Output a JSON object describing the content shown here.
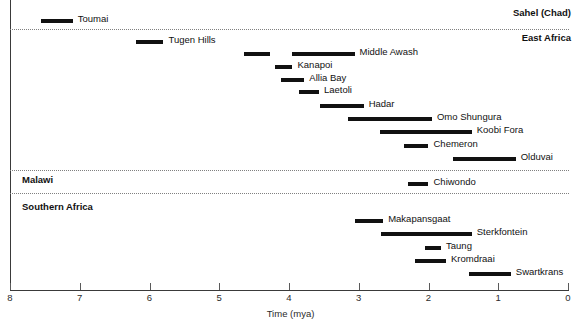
{
  "chart_data": {
    "type": "bar",
    "title": "",
    "subtitle": "",
    "xlabel": "Time (mya)",
    "ylabel": "",
    "xlim": [
      8,
      0
    ],
    "x_reversed": true,
    "grid": false,
    "legend": null,
    "orientation": "horizontal-ranges",
    "xticks": [
      8,
      7,
      6,
      5,
      4,
      3,
      2,
      1,
      0
    ],
    "xtick_labels": [
      "8",
      "7",
      "6",
      "5",
      "4",
      "3",
      "2",
      "1",
      "0"
    ],
    "groups": [
      {
        "region": "Sahel (Chad)",
        "region_label_align": "right",
        "sites": [
          {
            "name": "Toumai",
            "start_mya": 7.55,
            "end_mya": 7.1,
            "label_side": "right"
          }
        ]
      },
      {
        "region": "East Africa",
        "region_label_align": "right",
        "sites": [
          {
            "name": "Tugen Hills",
            "start_mya": 6.2,
            "end_mya": 5.8,
            "label_side": "right"
          },
          {
            "name": "Middle Awash",
            "start_mya": 4.65,
            "end_mya": 4.27,
            "label_side": "none",
            "segment": 1
          },
          {
            "name": "Middle Awash",
            "start_mya": 3.96,
            "end_mya": 3.06,
            "label_side": "right",
            "segment": 2
          },
          {
            "name": "Kanapoi",
            "start_mya": 4.2,
            "end_mya": 3.95,
            "label_side": "right"
          },
          {
            "name": "Allia Bay",
            "start_mya": 4.12,
            "end_mya": 3.78,
            "label_side": "right"
          },
          {
            "name": "Laetoli",
            "start_mya": 3.85,
            "end_mya": 3.57,
            "label_side": "right"
          },
          {
            "name": "Hadar",
            "start_mya": 3.55,
            "end_mya": 2.93,
            "label_side": "right"
          },
          {
            "name": "Omo Shungura",
            "start_mya": 3.15,
            "end_mya": 1.95,
            "label_side": "right"
          },
          {
            "name": "Koobi Fora",
            "start_mya": 2.7,
            "end_mya": 1.38,
            "label_side": "right"
          },
          {
            "name": "Chemeron",
            "start_mya": 2.35,
            "end_mya": 2.0,
            "label_side": "right"
          },
          {
            "name": "Olduvai",
            "start_mya": 1.65,
            "end_mya": 0.75,
            "label_side": "right"
          }
        ]
      },
      {
        "region": "Malawi",
        "region_label_align": "left",
        "sites": [
          {
            "name": "Chiwondo",
            "start_mya": 2.3,
            "end_mya": 2.0,
            "label_side": "right"
          }
        ]
      },
      {
        "region": "Southern Africa",
        "region_label_align": "left",
        "sites": [
          {
            "name": "Makapansgaat",
            "start_mya": 3.05,
            "end_mya": 2.65,
            "label_side": "right"
          },
          {
            "name": "Sterkfontein",
            "start_mya": 2.68,
            "end_mya": 1.38,
            "label_side": "right"
          },
          {
            "name": "Taung",
            "start_mya": 2.05,
            "end_mya": 1.82,
            "label_side": "right"
          },
          {
            "name": "Kromdraai",
            "start_mya": 2.2,
            "end_mya": 1.75,
            "label_side": "right"
          },
          {
            "name": "Swartkrans",
            "start_mya": 1.42,
            "end_mya": 0.82,
            "label_side": "right"
          }
        ]
      }
    ],
    "colors": {
      "bar": "#111111",
      "axis": "#3a3a3a",
      "divider": "#808080",
      "text": "#111111",
      "background": "#ffffff"
    }
  },
  "layout": {
    "rows": [
      {
        "key": "sahel-header",
        "y": 14,
        "type": "region",
        "region": "Sahel (Chad)"
      },
      {
        "key": "toumai",
        "y": 19,
        "type": "bar",
        "site": "Toumai"
      },
      {
        "key": "divider-1",
        "y": 29,
        "type": "divider"
      },
      {
        "key": "eastafrica-header",
        "y": 39,
        "type": "region",
        "region": "East Africa"
      },
      {
        "key": "tugen",
        "y": 40,
        "type": "bar",
        "site": "Tugen Hills"
      },
      {
        "key": "awash",
        "y": 52,
        "type": "bar",
        "site": "Middle Awash"
      },
      {
        "key": "kanapoi",
        "y": 65,
        "type": "bar",
        "site": "Kanapoi"
      },
      {
        "key": "alliabay",
        "y": 78,
        "type": "bar",
        "site": "Allia Bay"
      },
      {
        "key": "laetoli",
        "y": 90,
        "type": "bar",
        "site": "Laetoli"
      },
      {
        "key": "hadar",
        "y": 104,
        "type": "bar",
        "site": "Hadar"
      },
      {
        "key": "omo",
        "y": 117,
        "type": "bar",
        "site": "Omo Shungura"
      },
      {
        "key": "koobi",
        "y": 130,
        "type": "bar",
        "site": "Koobi Fora"
      },
      {
        "key": "chemeron",
        "y": 144,
        "type": "bar",
        "site": "Chemeron"
      },
      {
        "key": "olduvai",
        "y": 157,
        "type": "bar",
        "site": "Olduvai"
      },
      {
        "key": "divider-2",
        "y": 170,
        "type": "divider"
      },
      {
        "key": "malawi-header",
        "y": 181,
        "type": "region",
        "region": "Malawi"
      },
      {
        "key": "chiwondo",
        "y": 182,
        "type": "bar",
        "site": "Chiwondo"
      },
      {
        "key": "divider-3",
        "y": 193,
        "type": "divider"
      },
      {
        "key": "southern-header",
        "y": 208,
        "type": "region",
        "region": "Southern Africa"
      },
      {
        "key": "makapansgaat",
        "y": 219,
        "type": "bar",
        "site": "Makapansgaat"
      },
      {
        "key": "sterkfontein",
        "y": 232,
        "type": "bar",
        "site": "Sterkfontein"
      },
      {
        "key": "taung",
        "y": 246,
        "type": "bar",
        "site": "Taung"
      },
      {
        "key": "kromdraai",
        "y": 259,
        "type": "bar",
        "site": "Kromdraai"
      },
      {
        "key": "swartkrans",
        "y": 272,
        "type": "bar",
        "site": "Swartkrans"
      }
    ]
  }
}
